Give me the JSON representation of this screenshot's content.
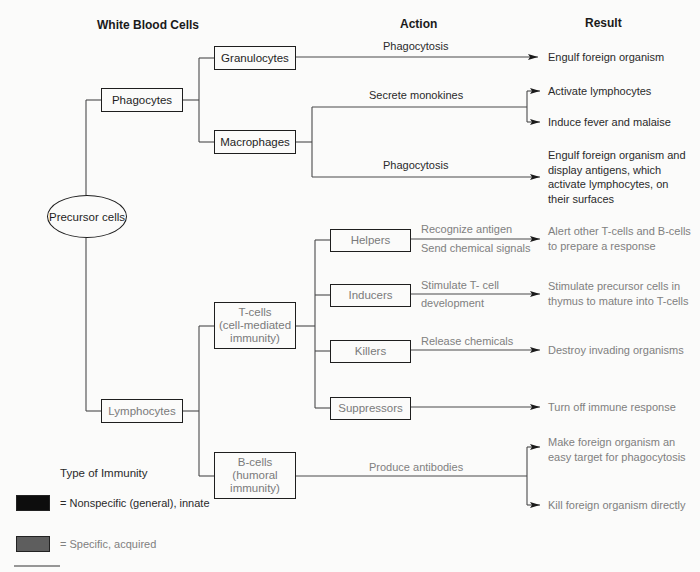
{
  "headers": {
    "cells": "White Blood Cells",
    "action": "Action",
    "result": "Result"
  },
  "root": {
    "label": "Precursor cells"
  },
  "phagocytes": {
    "label": "Phagocytes",
    "granulocytes": {
      "label": "Granulocytes",
      "action": "Phagocytosis",
      "result": "Engulf foreign organism"
    },
    "macrophages": {
      "label": "Macrophages",
      "actions": [
        {
          "label": "Secrete monokines",
          "results": [
            "Activate lymphocytes",
            "Induce fever and malaise"
          ]
        },
        {
          "label": "Phagocytosis",
          "results": [
            "Engulf foreign organism and display antigens, which activate lymphocytes, on their surfaces"
          ]
        }
      ]
    }
  },
  "lymphocytes": {
    "label": "Lymphocytes",
    "tcells": {
      "line1": "T-cells",
      "line2": "(cell-mediated",
      "line3": "immunity)",
      "subtypes": [
        {
          "label": "Helpers",
          "action1": "Recognize antigen",
          "action2": "Send chemical signals",
          "result": "Alert other T-cells and B-cells to prepare a response"
        },
        {
          "label": "Inducers",
          "action1": "Stimulate T- cell",
          "action2": "development",
          "result": "Stimulate precursor cells in thymus to mature into T-cells"
        },
        {
          "label": "Killers",
          "action1": "Release chemicals",
          "action2": "",
          "result": "Destroy invading organisms"
        },
        {
          "label": "Suppressors",
          "action1": "",
          "action2": "",
          "result": "Turn off immune response"
        }
      ]
    },
    "bcells": {
      "line1": "B-cells",
      "line2": "(humoral",
      "line3": "immunity)",
      "action": "Produce antibodies",
      "results": [
        "Make foreign organism an easy target for phagocytosis",
        "Kill foreign organism directly"
      ]
    }
  },
  "legend": {
    "title": "Type of Immunity",
    "items": [
      {
        "label": "= Nonspecific (general), innate",
        "color": "#0d0d0d"
      },
      {
        "label": "= Specific, acquired",
        "color": "#5e5e5e"
      }
    ]
  },
  "colors": {
    "innate_text": "#1e1e1e",
    "acquired_text": "#808080",
    "line": "#3a3a3a"
  }
}
